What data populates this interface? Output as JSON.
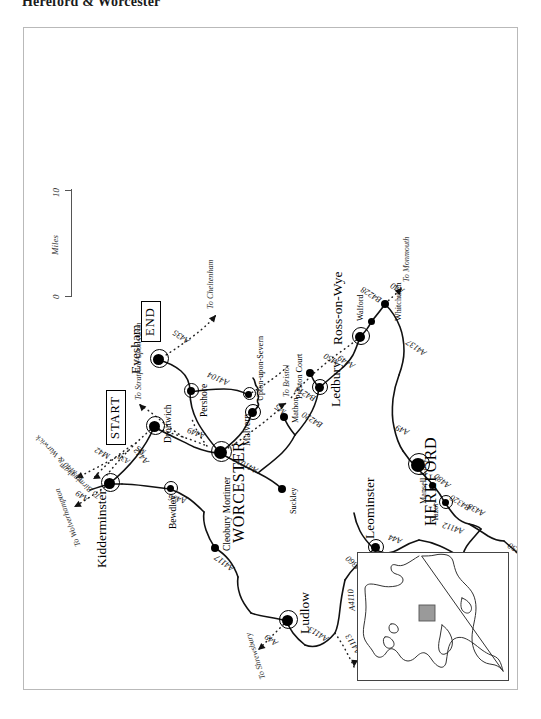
{
  "page": {
    "title": "Hereford & Worcester"
  },
  "map": {
    "route_markers": [
      {
        "id": "start",
        "label": "START",
        "at": "Droitwich"
      },
      {
        "id": "end",
        "label": "END",
        "at": "Evesham"
      }
    ],
    "scale": {
      "min_label": "0",
      "max_label": "10",
      "unit_label": "Miles"
    },
    "places": [
      {
        "name": "Droitwich",
        "size": "town",
        "marker": "large"
      },
      {
        "name": "WORCESTER",
        "size": "city-major",
        "marker": "large"
      },
      {
        "name": "Evesham",
        "size": "city",
        "marker": "large"
      },
      {
        "name": "Pershore",
        "size": "town",
        "marker": "medium"
      },
      {
        "name": "Malvern",
        "size": "town",
        "marker": "medium"
      },
      {
        "name": "Upton-upon-Severn",
        "size": "town-sm",
        "marker": "small"
      },
      {
        "name": "Kidderminster",
        "size": "city",
        "marker": "large"
      },
      {
        "name": "Bewdley",
        "size": "town",
        "marker": "small"
      },
      {
        "name": "Cleobury Mortimer",
        "size": "town",
        "marker": "small"
      },
      {
        "name": "Ludlow",
        "size": "city",
        "marker": "large"
      },
      {
        "name": "Leominster",
        "size": "city",
        "marker": "medium"
      },
      {
        "name": "Suckley",
        "size": "town-sm",
        "marker": "small"
      },
      {
        "name": "Mathon",
        "size": "town-sm",
        "marker": "small"
      },
      {
        "name": "Ledbury",
        "size": "city",
        "marker": "medium"
      },
      {
        "name": "Preston Court",
        "size": "town-sm",
        "marker": "small"
      },
      {
        "name": "Ross-on-Wye",
        "size": "city",
        "marker": "large"
      },
      {
        "name": "Walford",
        "size": "town-sm",
        "marker": "small"
      },
      {
        "name": "Whitchurch",
        "size": "town-sm",
        "marker": "small"
      },
      {
        "name": "HEREFORD",
        "size": "city-major",
        "marker": "large"
      },
      {
        "name": "Mansell Lacy",
        "size": "town-sm",
        "marker": "small"
      },
      {
        "name": "Yazor",
        "size": "town-sm",
        "marker": "small"
      },
      {
        "name": "Hay-on-Wye",
        "size": "city",
        "marker": "small"
      }
    ],
    "road_labels": [
      "M42",
      "A38",
      "M5",
      "A449",
      "A442",
      "A456",
      "A4117",
      "A4113",
      "A4110",
      "B4360",
      "A44",
      "A4112",
      "A438",
      "B4320",
      "A480",
      "B4350",
      "A49",
      "A4103",
      "B4220",
      "B4214",
      "A4104",
      "M50",
      "A435",
      "B4228",
      "A40",
      "A4137"
    ],
    "destination_arrows": [
      "To M40 & Warwick",
      "To Birmingham",
      "To Stratford-upon-Avon",
      "To Wolverhampton",
      "To Shrewsbury",
      "To Knighton",
      "To Cheltenham",
      "To Bristol",
      "To Monmouth"
    ],
    "inset": {
      "name": "locator-inset",
      "highlight_color": "#9a9a9a"
    },
    "colors": {
      "frame": "#b9b9b9",
      "road": "#111111",
      "node": "#000000",
      "text": "#000000"
    }
  }
}
